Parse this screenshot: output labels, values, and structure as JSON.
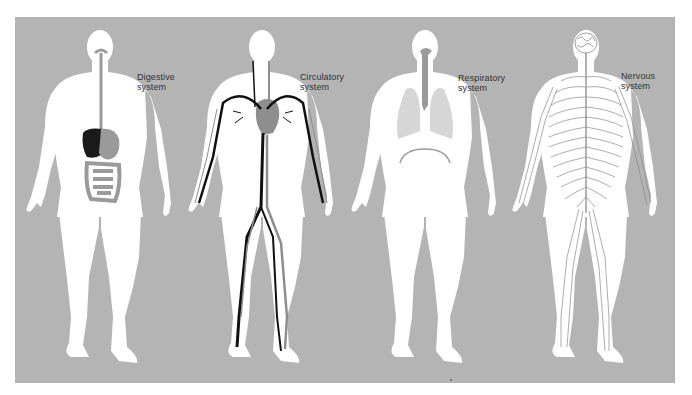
{
  "diagram": {
    "background_color": "#b4b4b4",
    "body_color": "#ffffff",
    "figures": [
      {
        "id": "digestive",
        "label_line1": "Digestive",
        "label_line2": "system",
        "organ_colors": {
          "liver": "#1a1a1a",
          "stomach_intestine": "#9a9a9a"
        }
      },
      {
        "id": "circulatory",
        "label_line1": "Circulatory",
        "label_line2": "system",
        "organ_colors": {
          "heart": "#8e8e8e",
          "vessels": "#111111",
          "veins": "#8e8e8e"
        }
      },
      {
        "id": "respiratory",
        "label_line1": "Respiratory",
        "label_line2": "system",
        "organ_colors": {
          "lungs": "#d4d4d4",
          "trachea": "#9a9a9a",
          "diaphragm": "#9a9a9a"
        }
      },
      {
        "id": "nervous",
        "label_line1": "Nervous",
        "label_line2": "system",
        "organ_colors": {
          "brain": "#ffffff",
          "nerves": "#8a8a8a"
        }
      }
    ]
  }
}
